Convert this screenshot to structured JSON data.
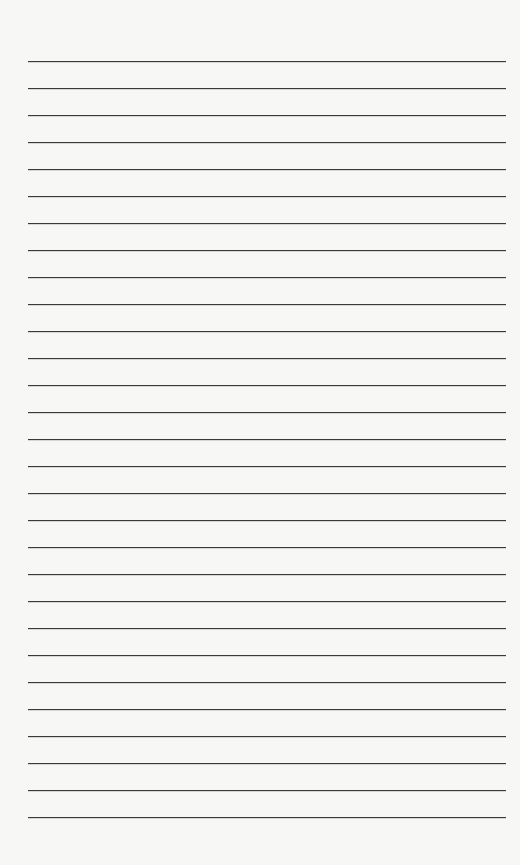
{
  "page": {
    "type": "lined-paper",
    "line_count": 29,
    "background_color": "#f7f7f6",
    "line_color": "#3a3a3a"
  }
}
